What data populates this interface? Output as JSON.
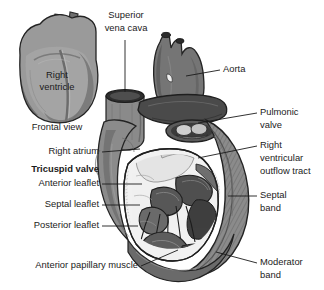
{
  "figure": {
    "background_color": "#ffffff",
    "text_color": "#1b1b1b",
    "palette": {
      "myocardium_mid": "#8d8d8d",
      "myocardium_dark": "#5a5a5a",
      "myocardium_darkest": "#3c3c3c",
      "endocardium_light": "#f2f2f2",
      "trabecula_light": "#d8d8d8",
      "outline": "#232323",
      "leader_line": "#1b1b1b"
    }
  },
  "inset": {
    "name": "frontal-view-inset",
    "caption": "Frontal view",
    "organ_label": {
      "line1": "Right",
      "line2": "ventricle"
    }
  },
  "labels": {
    "superior_vena_cava": {
      "id": "superior-vena-cava",
      "line1": "Superior",
      "line2": "vena cava",
      "align": "center",
      "x": 126,
      "y": 16
    },
    "aorta": {
      "id": "aorta",
      "text": "Aorta",
      "align": "left",
      "x": 223,
      "y": 70
    },
    "pulmonic_valve": {
      "id": "pulmonic-valve",
      "line1": "Pulmonic",
      "line2": "valve",
      "align": "left",
      "x": 260,
      "y": 113
    },
    "right_atrium": {
      "id": "right-atrium",
      "text": "Right atrium",
      "align": "right",
      "x": 99,
      "y": 152
    },
    "tricuspid_valve": {
      "id": "tricuspid-valve",
      "text": "Tricuspid valve",
      "bold": true,
      "align": "right",
      "x": 99,
      "y": 170
    },
    "anterior_leaflet": {
      "id": "anterior-leaflet",
      "text": "Anterior leaflet",
      "align": "right",
      "x": 99,
      "y": 184
    },
    "septal_leaflet": {
      "id": "septal-leaflet",
      "text": "Septal leaflet",
      "align": "right",
      "x": 99,
      "y": 205
    },
    "posterior_leaflet": {
      "id": "posterior-leaflet",
      "text": "Posterior leaflet",
      "align": "right",
      "x": 99,
      "y": 226
    },
    "right_ventricular_outflow_tract": {
      "id": "right-ventricular-outflow-tract",
      "line1": "Right",
      "line2": "ventricular",
      "line3": "outflow tract",
      "align": "left",
      "x": 260,
      "y": 150
    },
    "septal_band": {
      "id": "septal-band",
      "line1": "Septal",
      "line2": "band",
      "align": "left",
      "x": 260,
      "y": 196
    },
    "moderator_band": {
      "id": "moderator-band",
      "line1": "Moderator",
      "line2": "band",
      "align": "left",
      "x": 260,
      "y": 263
    },
    "anterior_papillary_muscle": {
      "id": "anterior-papillary-muscle",
      "text": "Anterior papillary muscle",
      "align": "right",
      "x": 138,
      "y": 266
    }
  }
}
